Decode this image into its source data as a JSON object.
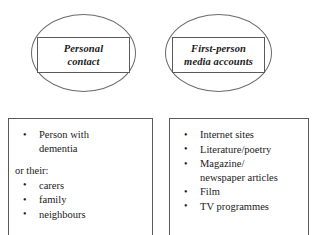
{
  "diagram": {
    "stroke_color": "#5a5a5a",
    "background_color": "#ffffff",
    "nodes": [
      {
        "id": "personal-contact",
        "shape": "ellipse-with-label-box",
        "label_lines": [
          "Personal",
          "contact"
        ],
        "detail_box": {
          "items": [
            {
              "lines": [
                "Person with",
                "dementia"
              ]
            }
          ],
          "sub_intro": "or their:",
          "sub_items": [
            {
              "lines": [
                "carers"
              ]
            },
            {
              "lines": [
                "family"
              ]
            },
            {
              "lines": [
                "neighbours"
              ]
            }
          ]
        }
      },
      {
        "id": "first-person-media-accounts",
        "shape": "ellipse-with-label-box",
        "label_lines": [
          "First-person",
          "media accounts"
        ],
        "detail_box": {
          "items": [
            {
              "lines": [
                "Internet sites"
              ]
            },
            {
              "lines": [
                "Literature/poetry"
              ]
            },
            {
              "lines": [
                "Magazine/",
                "newspaper articles"
              ]
            },
            {
              "lines": [
                "Film"
              ]
            },
            {
              "lines": [
                "TV programmes"
              ]
            }
          ]
        }
      }
    ]
  }
}
